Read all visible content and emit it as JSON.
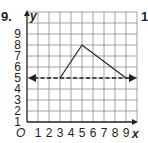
{
  "problem": {
    "number": "9.",
    "next_number": "10"
  },
  "graph": {
    "origin_label": "O",
    "x_axis_label": "x",
    "y_axis_label": "y",
    "x_ticks": [
      "1",
      "2",
      "3",
      "4",
      "5",
      "6",
      "7",
      "8",
      "9"
    ],
    "y_ticks": [
      "1",
      "2",
      "3",
      "4",
      "5",
      "6",
      "7",
      "8",
      "9"
    ],
    "grid": {
      "x_range": [
        0,
        10
      ],
      "y_range": [
        0,
        10
      ]
    },
    "triangle_vertices": [
      [
        3,
        4
      ],
      [
        5,
        7
      ],
      [
        9,
        4
      ]
    ],
    "dashed_line": {
      "equation": "y = 4",
      "arrows": "both"
    },
    "colors": {
      "ink": "#231f20",
      "grid": "#8a8a8a"
    }
  }
}
